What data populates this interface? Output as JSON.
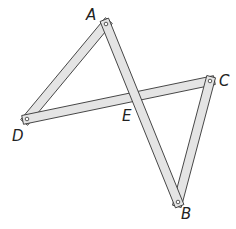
{
  "diagram": {
    "points": {
      "A": {
        "label": "A"
      },
      "B": {
        "label": "B"
      },
      "C": {
        "label": "C"
      },
      "D": {
        "label": "D"
      },
      "E": {
        "label": "E"
      }
    },
    "bars": [
      {
        "from": "A",
        "to": "D"
      },
      {
        "from": "D",
        "to": "C"
      },
      {
        "from": "C",
        "to": "B"
      },
      {
        "from": "A",
        "to": "B"
      }
    ],
    "colors": {
      "bar_fill": "#e4e4e4",
      "stroke": "#333333",
      "label": "#222222"
    }
  }
}
